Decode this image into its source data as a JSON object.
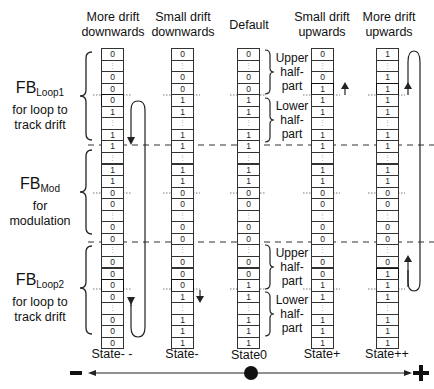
{
  "headers": [
    {
      "line1": "More drift",
      "line2": "downwards"
    },
    {
      "line1": "Small drift",
      "line2": "downwards"
    },
    {
      "line1": "Default",
      "line2": ""
    },
    {
      "line1": "Small drift",
      "line2": "upwards"
    },
    {
      "line1": "More drift",
      "line2": "upwards"
    }
  ],
  "state_labels": [
    "State- -",
    "State-",
    "State0",
    "State+",
    "State++"
  ],
  "sections": {
    "loop1": {
      "name": "FB",
      "sub": "Loop1",
      "desc1": "for loop to",
      "desc2": "track drift"
    },
    "mod": {
      "name": "FB",
      "sub": "Mod",
      "desc1": "for",
      "desc2": "modulation"
    },
    "loop2": {
      "name": "FB",
      "sub": "Loop2",
      "desc1": "for loop to",
      "desc2": "track drift"
    }
  },
  "half_labels": {
    "upper": [
      "Upper",
      "half-",
      "part"
    ],
    "lower": [
      "Lower",
      "half-",
      "part"
    ]
  },
  "axis": {
    "minus": "−",
    "plus": "+"
  },
  "columns": [
    {
      "state": "State- -",
      "cells": [
        "0",
        ":",
        "0",
        "0",
        "0",
        "1",
        ":",
        "1",
        "1",
        ":",
        "1",
        "1",
        "0",
        "0",
        ":",
        "0",
        "0",
        ":",
        "0",
        "0",
        "0",
        "0",
        ":",
        "0",
        "0",
        "0"
      ],
      "highlight": [
        4,
        20
      ]
    },
    {
      "state": "State-",
      "cells": [
        "0",
        ":",
        "0",
        "0",
        "1",
        "1",
        ":",
        "1",
        "1",
        ":",
        "1",
        "1",
        "0",
        "0",
        ":",
        "0",
        "0",
        ":",
        "0",
        "0",
        "0",
        "1",
        ":",
        "1",
        "1",
        "1"
      ],
      "highlight": [
        20
      ]
    },
    {
      "state": "State0",
      "cells": [
        "0",
        ":",
        "0",
        "0",
        "1",
        "1",
        ":",
        "1",
        "1",
        ":",
        "1",
        "1",
        "0",
        "0",
        ":",
        "0",
        "0",
        ":",
        "0",
        "0",
        "1",
        "1",
        ":",
        "1",
        "1",
        "1"
      ],
      "highlight": []
    },
    {
      "state": "State+",
      "cells": [
        "0",
        ":",
        "0",
        "1",
        "1",
        "1",
        ":",
        "1",
        "1",
        ":",
        "1",
        "1",
        "0",
        "0",
        ":",
        "0",
        "0",
        ":",
        "0",
        "0",
        "1",
        "1",
        ":",
        "1",
        "1",
        "1"
      ],
      "highlight": [
        3
      ]
    },
    {
      "state": "State++",
      "cells": [
        "1",
        ":",
        "1",
        "1",
        "1",
        "1",
        ":",
        "1",
        "1",
        ":",
        "1",
        "1",
        "0",
        "0",
        ":",
        "0",
        "0",
        ":",
        "0",
        "1",
        "1",
        "1",
        ":",
        "1",
        "1",
        "1"
      ],
      "highlight": [
        3,
        19
      ]
    }
  ]
}
